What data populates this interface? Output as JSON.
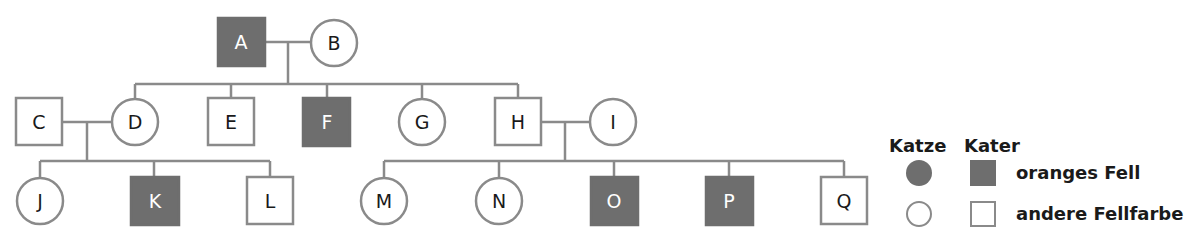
{
  "pedigree": {
    "individuals": {
      "A": {
        "label": "A",
        "sex": "male",
        "orange": true
      },
      "B": {
        "label": "B",
        "sex": "female",
        "orange": false
      },
      "C": {
        "label": "C",
        "sex": "male",
        "orange": false
      },
      "D": {
        "label": "D",
        "sex": "female",
        "orange": false
      },
      "E": {
        "label": "E",
        "sex": "male",
        "orange": false
      },
      "F": {
        "label": "F",
        "sex": "male",
        "orange": true
      },
      "G": {
        "label": "G",
        "sex": "female",
        "orange": false
      },
      "H": {
        "label": "H",
        "sex": "male",
        "orange": false
      },
      "I": {
        "label": "I",
        "sex": "female",
        "orange": false
      },
      "J": {
        "label": "J",
        "sex": "female",
        "orange": false
      },
      "K": {
        "label": "K",
        "sex": "male",
        "orange": true
      },
      "L": {
        "label": "L",
        "sex": "male",
        "orange": false
      },
      "M": {
        "label": "M",
        "sex": "female",
        "orange": false
      },
      "N": {
        "label": "N",
        "sex": "female",
        "orange": false
      },
      "O": {
        "label": "O",
        "sex": "male",
        "orange": true
      },
      "P": {
        "label": "P",
        "sex": "male",
        "orange": true
      },
      "Q": {
        "label": "Q",
        "sex": "male",
        "orange": false
      }
    },
    "couples": [
      [
        "A",
        "B"
      ],
      [
        "C",
        "D"
      ],
      [
        "H",
        "I"
      ]
    ],
    "children": {
      "A+B": [
        "D",
        "E",
        "F",
        "G",
        "H"
      ],
      "C+D": [
        "J",
        "K",
        "L"
      ],
      "H+I": [
        "M",
        "N",
        "O",
        "P",
        "Q"
      ]
    }
  },
  "legend": {
    "col_female": "Katze",
    "col_male": "Kater",
    "row_orange": "oranges Fell",
    "row_other": "andere Fellfarbe"
  },
  "colors": {
    "affected": "#6e6e6e",
    "line": "#8a8a8a"
  }
}
